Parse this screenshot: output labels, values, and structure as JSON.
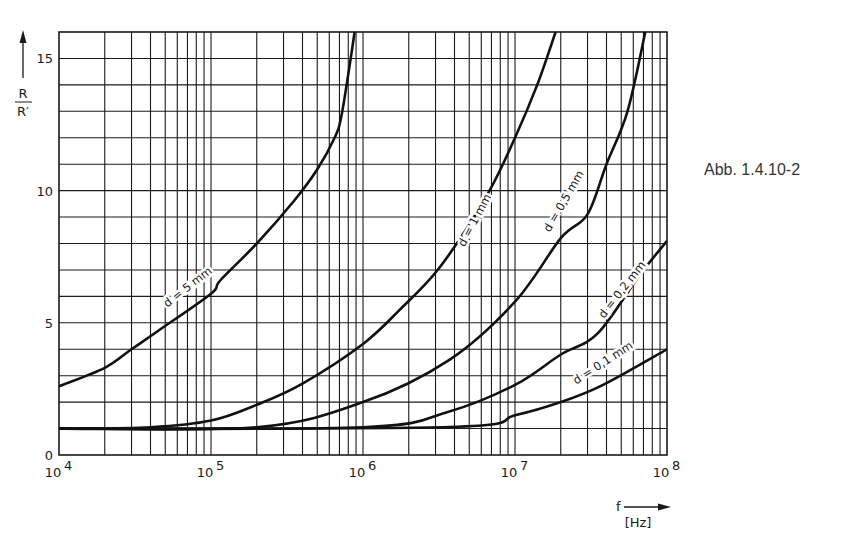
{
  "figure": {
    "caption": "Abb. 1.4.10-2"
  },
  "axes": {
    "y_label_num": "R",
    "y_label_den": "R′",
    "x_label": "f",
    "x_unit": "[Hz]"
  },
  "chart_data": {
    "type": "line",
    "title": "",
    "xlabel": "f [Hz]",
    "ylabel": "R / R′",
    "xscale": "log",
    "xlim": [
      10000,
      100000000
    ],
    "ylim": [
      0,
      16
    ],
    "grid": true,
    "x_ticks": [
      {
        "value": 10000,
        "base": "10",
        "exp": "4"
      },
      {
        "value": 100000,
        "base": "10",
        "exp": "5"
      },
      {
        "value": 1000000,
        "base": "10",
        "exp": "6"
      },
      {
        "value": 10000000,
        "base": "10",
        "exp": "7"
      },
      {
        "value": 100000000,
        "base": "10",
        "exp": "8"
      }
    ],
    "y_ticks": [
      0,
      5,
      10,
      15
    ],
    "series": [
      {
        "name": "d = 5 mm",
        "points": [
          [
            10000,
            2.6
          ],
          [
            20000,
            3.3
          ],
          [
            30000,
            4.0
          ],
          [
            45000,
            4.7
          ],
          [
            100000,
            6.1
          ],
          [
            115000,
            6.6
          ],
          [
            200000,
            8.0
          ],
          [
            350000,
            9.6
          ],
          [
            500000,
            10.8
          ],
          [
            650000,
            12.0
          ],
          [
            720000,
            12.8
          ],
          [
            830000,
            15.0
          ],
          [
            880000,
            16.0
          ]
        ]
      },
      {
        "name": "d = 1 mm",
        "points": [
          [
            10000,
            1.0
          ],
          [
            40000,
            1.05
          ],
          [
            100000,
            1.3
          ],
          [
            200000,
            1.9
          ],
          [
            400000,
            2.7
          ],
          [
            1000000,
            4.2
          ],
          [
            1750000,
            5.5
          ],
          [
            3200000,
            7.1
          ],
          [
            6500000,
            9.8
          ],
          [
            10000000,
            12.0
          ],
          [
            14000000,
            14.0
          ],
          [
            18500000,
            16.0
          ]
        ]
      },
      {
        "name": "d = 0,5 mm",
        "points": [
          [
            10000,
            1.0
          ],
          [
            200000,
            1.05
          ],
          [
            1000000,
            2.0
          ],
          [
            3700000,
            3.6
          ],
          [
            10000000,
            5.8
          ],
          [
            20000000,
            8.2
          ],
          [
            30000000,
            9.1
          ],
          [
            40000000,
            11.0
          ],
          [
            55000000,
            13.0
          ],
          [
            72000000,
            16.0
          ]
        ]
      },
      {
        "name": "d = 0,2 mm",
        "points": [
          [
            10000,
            1.0
          ],
          [
            1000000,
            1.05
          ],
          [
            3700000,
            1.65
          ],
          [
            10000000,
            2.65
          ],
          [
            20000000,
            3.8
          ],
          [
            35000000,
            4.6
          ],
          [
            66000000,
            6.8
          ],
          [
            100000000,
            8.1
          ]
        ]
      },
      {
        "name": "d = 0,1 mm",
        "points": [
          [
            10000,
            1.0
          ],
          [
            3700000,
            1.06
          ],
          [
            10000000,
            1.5
          ],
          [
            20000000,
            2.0
          ],
          [
            38000000,
            2.65
          ],
          [
            100000000,
            4.0
          ]
        ]
      }
    ],
    "annotations": [
      "d = 5 mm",
      "d = 1 mm",
      "d = 0,5 mm",
      "d = 0,2 mm",
      "d = 0,1 mm"
    ]
  }
}
